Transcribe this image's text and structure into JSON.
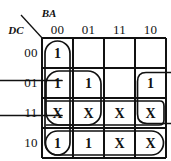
{
  "figure": {
    "type": "karnaugh-map",
    "variables_top_label": "BA",
    "variables_side_label": "DC",
    "column_headers": [
      "00",
      "01",
      "11",
      "10"
    ],
    "row_headers": [
      "00",
      "01",
      "11",
      "10"
    ],
    "ink_color": "#111111",
    "background_color": "#ffffff"
  },
  "cells": [
    {
      "row": "00",
      "col": "00",
      "value": "1"
    },
    {
      "row": "00",
      "col": "01",
      "value": ""
    },
    {
      "row": "00",
      "col": "11",
      "value": ""
    },
    {
      "row": "00",
      "col": "10",
      "value": ""
    },
    {
      "row": "01",
      "col": "00",
      "value": "1"
    },
    {
      "row": "01",
      "col": "01",
      "value": "1"
    },
    {
      "row": "01",
      "col": "11",
      "value": ""
    },
    {
      "row": "01",
      "col": "10",
      "value": "1"
    },
    {
      "row": "11",
      "col": "00",
      "value": "X"
    },
    {
      "row": "11",
      "col": "01",
      "value": "X"
    },
    {
      "row": "11",
      "col": "11",
      "value": "X"
    },
    {
      "row": "11",
      "col": "10",
      "value": "X"
    },
    {
      "row": "10",
      "col": "00",
      "value": "1"
    },
    {
      "row": "10",
      "col": "01",
      "value": "1"
    },
    {
      "row": "10",
      "col": "11",
      "value": "X"
    },
    {
      "row": "10",
      "col": "10",
      "value": "X"
    }
  ],
  "groups": [
    {
      "name": "column-00-full",
      "shape": "vertical-oval",
      "covers": "col 00, rows 00-10"
    },
    {
      "name": "rows-01-11-cols-00-01",
      "shape": "rounded-rect",
      "covers": "rows 01-11, cols 00-01"
    },
    {
      "name": "rows-01-11-wraparound",
      "shape": "wrap-horizontal",
      "covers": "rows 01-11, col 10 wrapping to col 00"
    },
    {
      "name": "row-11-full",
      "shape": "horizontal-band",
      "covers": "row 11, all columns"
    },
    {
      "name": "row-10-full",
      "shape": "horizontal-oval",
      "covers": "row 10, all columns"
    }
  ]
}
